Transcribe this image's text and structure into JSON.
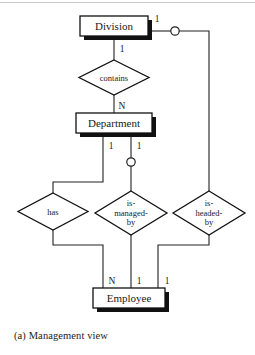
{
  "figure": {
    "caption": "(a) Management view",
    "diagram_type": "entity-relationship-diagram",
    "colors": {
      "background": "#ffffff",
      "line": "#222222",
      "text": "#1a1a1a",
      "shadow": "#111111"
    }
  },
  "entities": [
    {
      "id": "division",
      "label": "Division"
    },
    {
      "id": "department",
      "label": "Department"
    },
    {
      "id": "employee",
      "label": "Employee"
    }
  ],
  "relationships": [
    {
      "id": "contains",
      "label": "contains",
      "lines": [
        "contains"
      ]
    },
    {
      "id": "has",
      "label": "has",
      "lines": [
        "has"
      ]
    },
    {
      "id": "is-managed-by",
      "label": "is-managed-by",
      "lines": [
        "is-",
        "managed-",
        "by"
      ]
    },
    {
      "id": "is-headed-by",
      "label": "is-headed-by",
      "lines": [
        "is-",
        "headed-",
        "by"
      ]
    }
  ],
  "cardinalities": {
    "division_contains": "1",
    "division_is_headed_by": "1",
    "contains_department": "N",
    "department_has": "1",
    "department_is_managed_by": "1",
    "employee_has": "N",
    "employee_is_managed_by": "1",
    "employee_is_headed_by": "1"
  },
  "connectors": [
    {
      "id": "division-headed-circle",
      "shape": "circle"
    },
    {
      "id": "department-managed-circle",
      "shape": "circle"
    }
  ]
}
